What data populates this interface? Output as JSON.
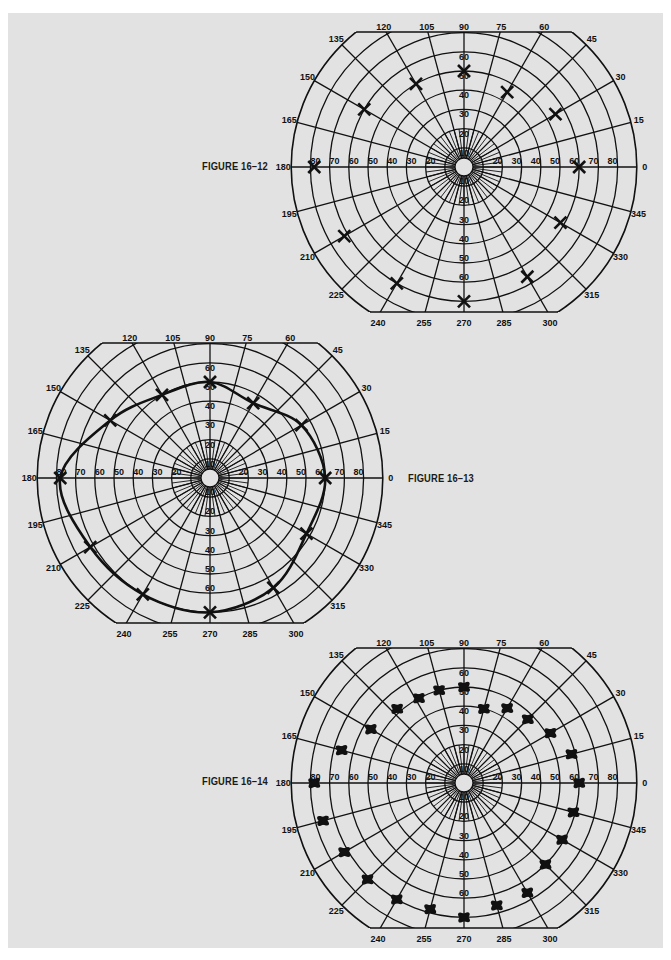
{
  "page": {
    "background": "#e2e2e2",
    "line_color": "#111111"
  },
  "figures": [
    {
      "label": "FIGURE 16–12"
    },
    {
      "label": "FIGURE 16–13"
    },
    {
      "label": "FIGURE 16–14"
    }
  ],
  "chart_data": [
    {
      "type": "scatter",
      "title": "FIGURE 16–12",
      "coordinate_system": "polar (visual field perimetry chart)",
      "angle_ticks": [
        0,
        15,
        30,
        45,
        60,
        75,
        90,
        105,
        120,
        135,
        150,
        165,
        180,
        195,
        210,
        225,
        240,
        255,
        270,
        285,
        300,
        315,
        330,
        345
      ],
      "radial_ticks": [
        10,
        20,
        30,
        40,
        50,
        60,
        70,
        80
      ],
      "radial_range": [
        0,
        90
      ],
      "marker": "x",
      "connected": false,
      "points": [
        {
          "angle": 0,
          "radius": 60
        },
        {
          "angle": 30,
          "radius": 55
        },
        {
          "angle": 60,
          "radius": 45
        },
        {
          "angle": 90,
          "radius": 50
        },
        {
          "angle": 120,
          "radius": 50
        },
        {
          "angle": 150,
          "radius": 60
        },
        {
          "angle": 180,
          "radius": 78
        },
        {
          "angle": 210,
          "radius": 72
        },
        {
          "angle": 240,
          "radius": 70
        },
        {
          "angle": 270,
          "radius": 70
        },
        {
          "angle": 300,
          "radius": 66
        },
        {
          "angle": 330,
          "radius": 58
        }
      ]
    },
    {
      "type": "line",
      "title": "FIGURE 16–13",
      "coordinate_system": "polar (visual field perimetry chart)",
      "angle_ticks": [
        0,
        15,
        30,
        45,
        60,
        75,
        90,
        105,
        120,
        135,
        150,
        165,
        180,
        195,
        210,
        225,
        240,
        255,
        270,
        285,
        300,
        315,
        330,
        345
      ],
      "radial_ticks": [
        10,
        20,
        30,
        40,
        50,
        60,
        70,
        80
      ],
      "radial_range": [
        0,
        90
      ],
      "marker": "x",
      "connected": true,
      "points": [
        {
          "angle": 0,
          "radius": 60
        },
        {
          "angle": 30,
          "radius": 55
        },
        {
          "angle": 60,
          "radius": 45
        },
        {
          "angle": 90,
          "radius": 50
        },
        {
          "angle": 120,
          "radius": 50
        },
        {
          "angle": 150,
          "radius": 60
        },
        {
          "angle": 180,
          "radius": 78
        },
        {
          "angle": 210,
          "radius": 72
        },
        {
          "angle": 240,
          "radius": 70
        },
        {
          "angle": 270,
          "radius": 70
        },
        {
          "angle": 300,
          "radius": 66
        },
        {
          "angle": 330,
          "radius": 58
        }
      ]
    },
    {
      "type": "scatter",
      "title": "FIGURE 16–14",
      "coordinate_system": "polar (visual field perimetry chart)",
      "angle_ticks": [
        0,
        15,
        30,
        45,
        60,
        75,
        90,
        105,
        120,
        135,
        150,
        165,
        180,
        195,
        210,
        225,
        240,
        255,
        270,
        285,
        300,
        315,
        330,
        345
      ],
      "radial_ticks": [
        10,
        20,
        30,
        40,
        50,
        60,
        70,
        80
      ],
      "radial_range": [
        0,
        90
      ],
      "marker": "blot",
      "connected": false,
      "points": [
        {
          "angle": 0,
          "radius": 60
        },
        {
          "angle": 15,
          "radius": 58
        },
        {
          "angle": 30,
          "radius": 52
        },
        {
          "angle": 45,
          "radius": 47
        },
        {
          "angle": 60,
          "radius": 45
        },
        {
          "angle": 75,
          "radius": 40
        },
        {
          "angle": 90,
          "radius": 50
        },
        {
          "angle": 105,
          "radius": 50
        },
        {
          "angle": 118,
          "radius": 50
        },
        {
          "angle": 132,
          "radius": 52
        },
        {
          "angle": 150,
          "radius": 56
        },
        {
          "angle": 165,
          "radius": 66
        },
        {
          "angle": 180,
          "radius": 78
        },
        {
          "angle": 195,
          "radius": 76
        },
        {
          "angle": 210,
          "radius": 72
        },
        {
          "angle": 225,
          "radius": 71
        },
        {
          "angle": 240,
          "radius": 70
        },
        {
          "angle": 255,
          "radius": 68
        },
        {
          "angle": 270,
          "radius": 70
        },
        {
          "angle": 285,
          "radius": 66
        },
        {
          "angle": 300,
          "radius": 66
        },
        {
          "angle": 315,
          "radius": 60
        },
        {
          "angle": 330,
          "radius": 59
        },
        {
          "angle": 345,
          "radius": 59
        }
      ]
    }
  ]
}
